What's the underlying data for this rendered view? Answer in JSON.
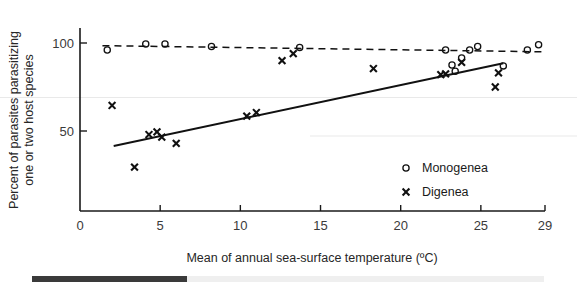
{
  "chart_data": {
    "type": "scatter",
    "title": "",
    "xlabel": "Mean of annual sea-surface temperature (ºC)",
    "ylabel": "Percent of parasites parasitizing\none or two host species",
    "ylabel_line1": "Percent of parasites parasitizing",
    "ylabel_line2": "one or two host species",
    "xlim": [
      0,
      29
    ],
    "ylim": [
      0,
      108
    ],
    "xticks": [
      0,
      5,
      10,
      15,
      20,
      25,
      29
    ],
    "xticklabels": [
      "0",
      "5",
      "10",
      "15",
      "20",
      "25",
      "29"
    ],
    "yticks": [
      50,
      100
    ],
    "yticklabels": [
      "50",
      "100"
    ],
    "grid": false,
    "legend_position": "inside-right-lower",
    "series": [
      {
        "name": "Monogenea",
        "marker": "circle",
        "trendline": "dashed",
        "trend_x": [
          1.4,
          28.8
        ],
        "trend_y": [
          98.5,
          95.0
        ],
        "points": [
          {
            "x": 1.7,
            "y": 96.0
          },
          {
            "x": 4.1,
            "y": 99.5
          },
          {
            "x": 5.3,
            "y": 99.5
          },
          {
            "x": 8.2,
            "y": 98.0
          },
          {
            "x": 13.7,
            "y": 97.5
          },
          {
            "x": 22.8,
            "y": 96.0
          },
          {
            "x": 23.2,
            "y": 87.5
          },
          {
            "x": 23.4,
            "y": 84.0
          },
          {
            "x": 23.8,
            "y": 91.5
          },
          {
            "x": 24.3,
            "y": 96.0
          },
          {
            "x": 24.8,
            "y": 98.0
          },
          {
            "x": 26.4,
            "y": 87.0
          },
          {
            "x": 27.9,
            "y": 96.0
          },
          {
            "x": 28.6,
            "y": 99.0
          }
        ]
      },
      {
        "name": "Digenea",
        "marker": "x",
        "trendline": "solid",
        "trend_x": [
          2.1,
          26.4
        ],
        "trend_y": [
          41.5,
          88.5
        ],
        "points": [
          {
            "x": 2.0,
            "y": 64.5
          },
          {
            "x": 3.4,
            "y": 29.5
          },
          {
            "x": 4.3,
            "y": 48.0
          },
          {
            "x": 4.8,
            "y": 49.5
          },
          {
            "x": 5.1,
            "y": 46.5
          },
          {
            "x": 6.0,
            "y": 43.0
          },
          {
            "x": 10.4,
            "y": 58.5
          },
          {
            "x": 11.0,
            "y": 60.5
          },
          {
            "x": 12.6,
            "y": 90.0
          },
          {
            "x": 13.3,
            "y": 94.0
          },
          {
            "x": 18.3,
            "y": 85.5
          },
          {
            "x": 22.5,
            "y": 82.0
          },
          {
            "x": 22.8,
            "y": 82.5
          },
          {
            "x": 23.8,
            "y": 89.0
          },
          {
            "x": 26.1,
            "y": 83.0
          },
          {
            "x": 25.9,
            "y": 75.0
          }
        ]
      }
    ]
  },
  "legend": {
    "items": [
      {
        "label": "Monogenea",
        "marker": "circle"
      },
      {
        "label": "Digenea",
        "marker": "x"
      }
    ]
  },
  "scrollbar": {
    "present": true
  }
}
